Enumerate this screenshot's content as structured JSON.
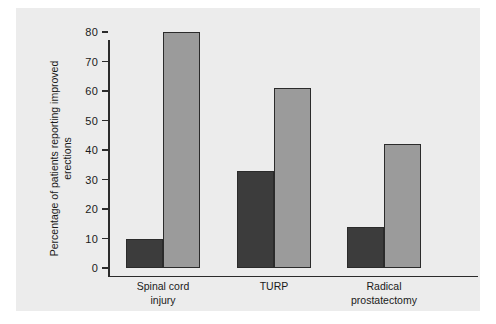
{
  "chart_data": {
    "type": "bar",
    "title": "",
    "xlabel": "",
    "ylabel": "Percentage of patients reporting improved erections",
    "ylim": [
      0,
      80
    ],
    "yticks": [
      0,
      10,
      20,
      30,
      40,
      50,
      60,
      70,
      80
    ],
    "ytick_labels": [
      "0",
      "10",
      "20",
      "30",
      "40",
      "50",
      "60",
      "70",
      "80"
    ],
    "grid": false,
    "legend": "none",
    "categories": [
      "Spinal cord\ninjury",
      "TURP",
      "Radical\nprostatectomy"
    ],
    "series": [
      {
        "name": "dark",
        "color": "#3c3c3c",
        "values": [
          10,
          33,
          14
        ]
      },
      {
        "name": "light",
        "color": "#9b9b9b",
        "values": [
          80,
          61,
          42
        ]
      }
    ],
    "colors": {
      "dark_bar": "#3c3c3c",
      "light_bar": "#9b9b9b",
      "axis": "#2b2b2b",
      "panel_background": "#ececec",
      "page_background": "#ffffff"
    }
  }
}
